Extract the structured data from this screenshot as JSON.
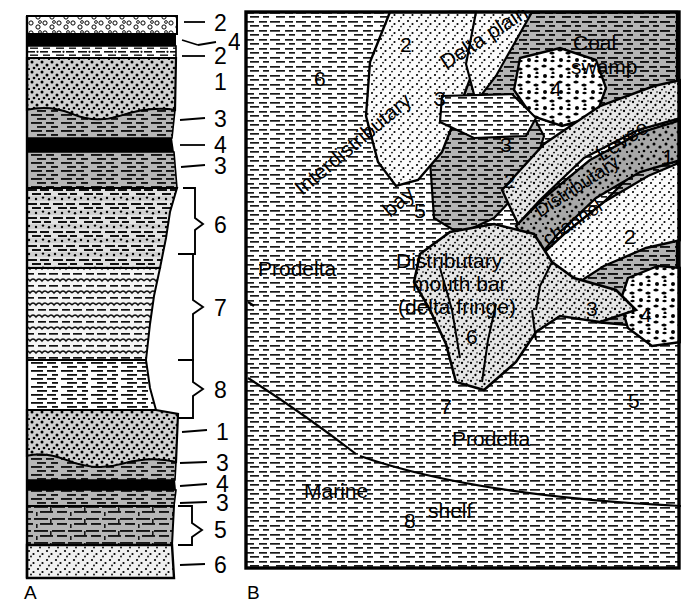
{
  "figure": {
    "panel_a_label": "A",
    "panel_b_label": "B"
  },
  "column": {
    "title": "vertical stratigraphic section",
    "units": [
      {
        "id": "u1",
        "facies_number": "2",
        "pattern": "coarse-sand-conglomerate",
        "top": 16,
        "bottom": 34
      },
      {
        "id": "u2",
        "facies_number": "4",
        "pattern": "coal",
        "top": 34,
        "bottom": 46
      },
      {
        "id": "u3",
        "facies_number": "2",
        "pattern": "silty-laminated",
        "top": 46,
        "bottom": 58
      },
      {
        "id": "u4",
        "facies_number": "1",
        "pattern": "sandstone-stippled-dark",
        "top": 58,
        "bottom": 110
      },
      {
        "id": "u5",
        "facies_number": "3",
        "pattern": "shale-gray",
        "top": 110,
        "bottom": 138
      },
      {
        "id": "u6",
        "facies_number": "4",
        "pattern": "coal",
        "top": 138,
        "bottom": 152
      },
      {
        "id": "u7",
        "facies_number": "3",
        "pattern": "shale-gray",
        "top": 152,
        "bottom": 188
      },
      {
        "id": "u8",
        "facies_number": "6",
        "pattern": "interbedded-sand-shale",
        "top": 188,
        "bottom": 268
      },
      {
        "id": "u9",
        "facies_number": "7",
        "pattern": "thin-interbedded-silt",
        "top": 268,
        "bottom": 360
      },
      {
        "id": "u10",
        "facies_number": "8",
        "pattern": "laminated-shale-white",
        "top": 360,
        "bottom": 410
      },
      {
        "id": "u11",
        "facies_number": "1",
        "pattern": "sandstone-stippled-dark",
        "top": 410,
        "bottom": 462
      },
      {
        "id": "u12",
        "facies_number": "3",
        "pattern": "shale-gray",
        "top": 462,
        "bottom": 480
      },
      {
        "id": "u13",
        "facies_number": "4",
        "pattern": "coal",
        "top": 480,
        "bottom": 489
      },
      {
        "id": "u14",
        "facies_number": "3",
        "pattern": "shale-gray",
        "top": 489,
        "bottom": 505
      },
      {
        "id": "u15",
        "facies_number": "5",
        "pattern": "limestone-shale",
        "top": 505,
        "bottom": 545
      },
      {
        "id": "u16",
        "facies_number": "6",
        "pattern": "sandstone-light",
        "top": 545,
        "bottom": 578
      }
    ],
    "leader_labels": [
      {
        "text": "2",
        "x": 222,
        "y": 24,
        "kind": "leader"
      },
      {
        "text": "4",
        "x": 236,
        "y": 42,
        "kind": "leader"
      },
      {
        "text": "2",
        "x": 222,
        "y": 57,
        "kind": "leader"
      },
      {
        "text": "1",
        "x": 222,
        "y": 82,
        "kind": "plain"
      },
      {
        "text": "3",
        "x": 222,
        "y": 120,
        "kind": "leader"
      },
      {
        "text": "4",
        "x": 222,
        "y": 145,
        "kind": "leader"
      },
      {
        "text": "3",
        "x": 222,
        "y": 167,
        "kind": "leader"
      },
      {
        "text": "6",
        "x": 222,
        "y": 226,
        "kind": "brace"
      },
      {
        "text": "7",
        "x": 222,
        "y": 308,
        "kind": "brace"
      },
      {
        "text": "8",
        "x": 222,
        "y": 390,
        "kind": "brace"
      },
      {
        "text": "1",
        "x": 222,
        "y": 434,
        "kind": "leader"
      },
      {
        "text": "3",
        "x": 222,
        "y": 465,
        "kind": "leader"
      },
      {
        "text": "4",
        "x": 222,
        "y": 486,
        "kind": "leader"
      },
      {
        "text": "3",
        "x": 222,
        "y": 505,
        "kind": "leader"
      },
      {
        "text": "5",
        "x": 222,
        "y": 530,
        "kind": "brace"
      },
      {
        "text": "6",
        "x": 222,
        "y": 567,
        "kind": "leader"
      }
    ]
  },
  "map": {
    "environments": [
      {
        "name": "delta-plain",
        "label": "Delta plain",
        "x": 446,
        "y": 64,
        "rotate": -33
      },
      {
        "name": "coal-swamp-line1",
        "label": "Coal",
        "x": 580,
        "y": 42,
        "rotate": 0
      },
      {
        "name": "coal-swamp-line2",
        "label": "swamp",
        "x": 578,
        "y": 66,
        "rotate": 0
      },
      {
        "name": "levee",
        "label": "Levee",
        "x": 610,
        "y": 152,
        "rotate": -33
      },
      {
        "name": "distributary-channel-line1",
        "label": "Distributary",
        "x": 557,
        "y": 215,
        "rotate": -33
      },
      {
        "name": "distributary-channel-line2",
        "label": "channel",
        "x": 562,
        "y": 241,
        "rotate": -33
      },
      {
        "name": "interdistributary-line1",
        "label": "Interdistributary",
        "x": 340,
        "y": 170,
        "rotate": -40
      },
      {
        "name": "interdistributary-line2",
        "label": "bay",
        "x": 389,
        "y": 200,
        "rotate": -40
      },
      {
        "name": "prodelta-upper",
        "label": "Prodelta",
        "x": 289,
        "y": 268,
        "rotate": 0
      },
      {
        "name": "prodelta-lower",
        "label": "Prodelta",
        "x": 494,
        "y": 440,
        "rotate": 0
      },
      {
        "name": "distributary-mouth-bar-line1",
        "label": "Distributary",
        "x": 458,
        "y": 260,
        "rotate": 0
      },
      {
        "name": "distributary-mouth-bar-line2",
        "label": "mouth bar",
        "x": 458,
        "y": 283,
        "rotate": 0
      },
      {
        "name": "distributary-mouth-bar-line3",
        "label": "(delta fringe)",
        "x": 458,
        "y": 305,
        "rotate": 0
      },
      {
        "name": "marine-shelf-line1",
        "label": "Marine",
        "x": 345,
        "y": 486,
        "rotate": 0
      },
      {
        "name": "marine-shelf-line2",
        "label": "shelf",
        "x": 471,
        "y": 507,
        "rotate": 0
      }
    ],
    "facies_numbers": [
      {
        "label": "6",
        "x": 320,
        "y": 74
      },
      {
        "label": "2",
        "x": 404,
        "y": 40
      },
      {
        "label": "3",
        "x": 437,
        "y": 93
      },
      {
        "label": "4",
        "x": 554,
        "y": 81
      },
      {
        "label": "3",
        "x": 503,
        "y": 141
      },
      {
        "label": "2",
        "x": 508,
        "y": 176
      },
      {
        "label": "1",
        "x": 664,
        "y": 155
      },
      {
        "label": "2",
        "x": 625,
        "y": 233
      },
      {
        "label": "5",
        "x": 418,
        "y": 207
      },
      {
        "label": "6",
        "x": 468,
        "y": 330
      },
      {
        "label": "3",
        "x": 589,
        "y": 303
      },
      {
        "label": "4",
        "x": 641,
        "y": 311
      },
      {
        "label": "5",
        "x": 629,
        "y": 400
      },
      {
        "label": "7",
        "x": 441,
        "y": 406
      },
      {
        "label": "8",
        "x": 406,
        "y": 518
      }
    ]
  },
  "colors": {
    "shale_gray": "#b3b3b3",
    "sand_light": "#f2f2f2",
    "sand_medium": "#d9d9d9",
    "coal_black": "#000000",
    "line": "#000000",
    "background": "#ffffff"
  }
}
